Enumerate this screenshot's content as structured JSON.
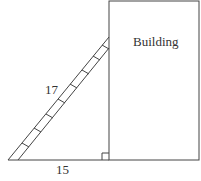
{
  "diagram": {
    "type": "ladder-against-building",
    "building_label": "Building",
    "ladder_length_label": "17",
    "base_distance_label": "15",
    "right_angle_marker": true,
    "rung_count": 8,
    "colors": {
      "stroke": "#444444",
      "text": "#333333",
      "background": "#ffffff"
    }
  }
}
